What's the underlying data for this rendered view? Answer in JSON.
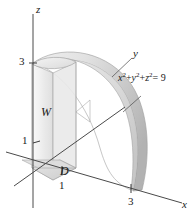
{
  "figure": {
    "type": "3d-solid-diagram",
    "axes": {
      "z_label": "z",
      "y_label": "y",
      "x_label": "x"
    },
    "ticks": {
      "z_three": "3",
      "z_one": "1",
      "x_one": "1",
      "x_three": "3"
    },
    "solid_label": "W",
    "base_region_label": "D",
    "equation": {
      "x_base": "x",
      "x_exp": "2",
      "plus_one": "+",
      "y_base": "y",
      "y_exp": "2",
      "plus_two": "+",
      "z_base": "z",
      "z_exp": "2",
      "equals": "= 9"
    },
    "colors": {
      "axis": "#4a4a4a",
      "outline": "#8a8a8a",
      "surface_light": "#f2f2f2",
      "surface_mid": "#d8d8d8",
      "surface_dark": "#b8b8b8",
      "text": "#1a1a1a"
    }
  }
}
